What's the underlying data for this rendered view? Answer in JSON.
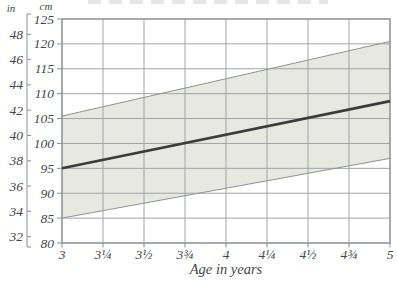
{
  "chart_data": {
    "type": "area",
    "title": "",
    "xlabel": "Age in years",
    "left_axis_unit": "in",
    "right_axis_unit": "cm",
    "x_range": [
      3,
      5
    ],
    "x_ticks": [
      {
        "v": 3,
        "label": "3"
      },
      {
        "v": 3.25,
        "label": "3¼"
      },
      {
        "v": 3.5,
        "label": "3½"
      },
      {
        "v": 3.75,
        "label": "3¾"
      },
      {
        "v": 4,
        "label": "4"
      },
      {
        "v": 4.25,
        "label": "4¼"
      },
      {
        "v": 4.5,
        "label": "4½"
      },
      {
        "v": 4.75,
        "label": "4¾"
      },
      {
        "v": 5,
        "label": "5"
      }
    ],
    "y_cm_range": [
      80,
      125
    ],
    "y_cm_ticks": [
      125,
      120,
      115,
      110,
      105,
      100,
      95,
      90,
      85,
      80
    ],
    "y_in_ticks": [
      48,
      46,
      44,
      42,
      40,
      38,
      36,
      34,
      32
    ],
    "cm_per_inch": 2.54,
    "band": {
      "upper": [
        [
          3,
          105.5
        ],
        [
          5,
          120.5
        ]
      ],
      "lower": [
        [
          3,
          85
        ],
        [
          5,
          97
        ]
      ]
    },
    "series": [
      {
        "name": "average-height-line",
        "points": [
          [
            3,
            95
          ],
          [
            5,
            108.5
          ]
        ]
      }
    ],
    "grid": true,
    "legend": "none",
    "colors": {
      "band_fill": "#e7e8e2",
      "band_edge": "#8f948f",
      "grid": "#a0a4a8",
      "border": "#8b9094",
      "center_line": "#3c3c3c",
      "text": "#43474b"
    }
  }
}
